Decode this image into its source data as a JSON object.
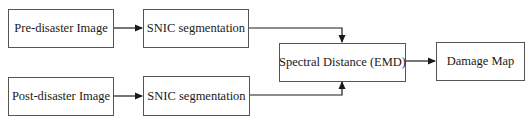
{
  "diagram": {
    "type": "flowchart",
    "nodes": [
      {
        "id": "pre",
        "label": "Pre-disaster Image"
      },
      {
        "id": "snic1",
        "label": "SNIC segmentation"
      },
      {
        "id": "post",
        "label": "Post-disaster Image"
      },
      {
        "id": "snic2",
        "label": "SNIC segmentation"
      },
      {
        "id": "emd",
        "label": "Spectral Distance (EMD)"
      },
      {
        "id": "map",
        "label": "Damage Map"
      }
    ],
    "edges": [
      {
        "from": "pre",
        "to": "snic1"
      },
      {
        "from": "post",
        "to": "snic2"
      },
      {
        "from": "snic1",
        "to": "emd"
      },
      {
        "from": "snic2",
        "to": "emd"
      },
      {
        "from": "emd",
        "to": "map"
      }
    ],
    "colors": {
      "line": "#1a1a1a",
      "border": "#555555",
      "background": "#ffffff"
    }
  }
}
